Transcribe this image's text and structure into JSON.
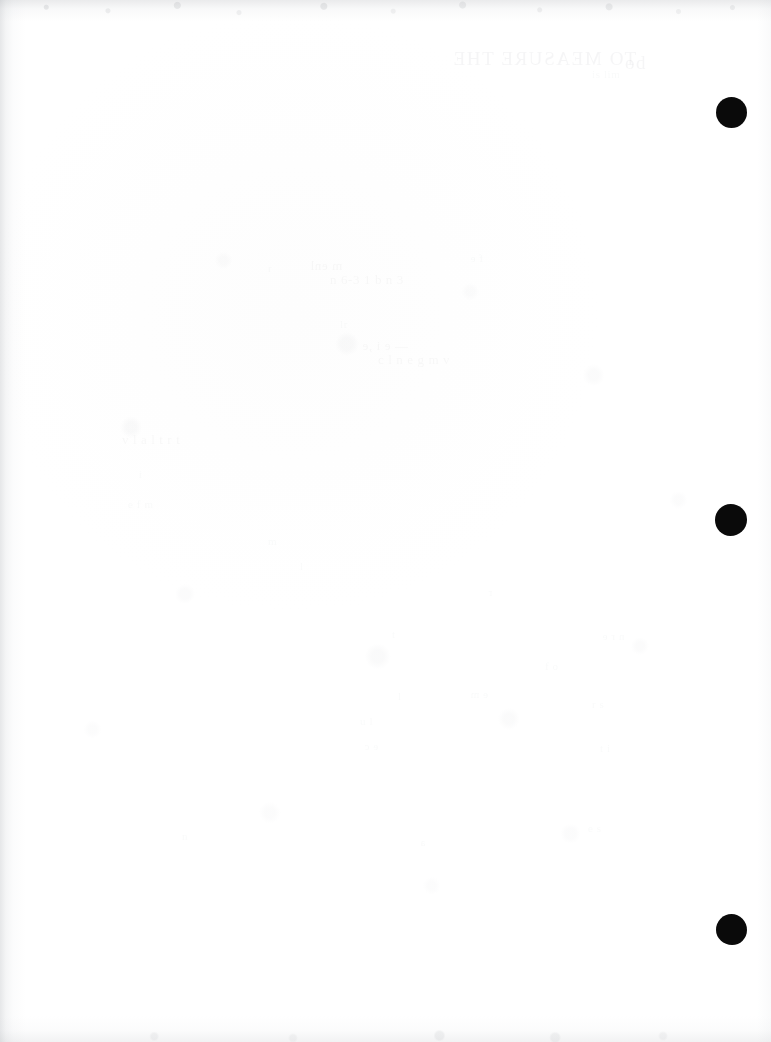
{
  "page": {
    "kind": "scanned-blank-page",
    "width": 771,
    "height": 1042,
    "background_color": "#ffffff",
    "mark_color": "#0a0a0a",
    "shadow_color": "#8c919a",
    "ghost_text_color": "#787c84"
  },
  "marks": {
    "label": "punch-marks",
    "items": [
      {
        "name": "punch-mark-top",
        "x": 716,
        "y": 97,
        "size": 31,
        "shape": "circle"
      },
      {
        "name": "punch-mark-middle",
        "x": 715,
        "y": 504,
        "size": 32,
        "shape": "circle-irregular"
      },
      {
        "name": "punch-mark-bottom",
        "x": 716,
        "y": 914,
        "size": 31,
        "shape": "circle-irregular"
      }
    ]
  },
  "ghost_text": {
    "note": "illegible bleed-through / show-through from the reverse side of the sheet",
    "lines": [
      {
        "x": 452,
        "y": 48,
        "text": "TO MEASURE THE",
        "style": "heading"
      },
      {
        "x": 625,
        "y": 52,
        "text": "od",
        "style": "heading"
      },
      {
        "x": 592,
        "y": 68,
        "text": "is  lim",
        "style": "small"
      },
      {
        "x": 310,
        "y": 258,
        "text": "m  enl",
        "style": "body"
      },
      {
        "x": 330,
        "y": 272,
        "text": "n  6-3  1  b        n 3",
        "style": "body"
      },
      {
        "x": 340,
        "y": 318,
        "text": "lr",
        "style": "small"
      },
      {
        "x": 362,
        "y": 338,
        "text": "— e  i ,e",
        "style": "body"
      },
      {
        "x": 378,
        "y": 352,
        "text": "c l  n e g  m   v",
        "style": "body"
      },
      {
        "x": 122,
        "y": 432,
        "text": "v l    a l t   r t",
        "style": "body"
      },
      {
        "x": 138,
        "y": 468,
        "text": "i",
        "style": "small"
      },
      {
        "x": 128,
        "y": 498,
        "text": "e  f m",
        "style": "small"
      },
      {
        "x": 268,
        "y": 262,
        "text": "r",
        "style": "small"
      },
      {
        "x": 470,
        "y": 252,
        "text": "f e",
        "style": "small"
      },
      {
        "x": 268,
        "y": 535,
        "text": "m",
        "style": "small"
      },
      {
        "x": 392,
        "y": 628,
        "text": "t",
        "style": "small"
      },
      {
        "x": 602,
        "y": 630,
        "text": "n  r e",
        "style": "small"
      },
      {
        "x": 545,
        "y": 660,
        "text": "f  o",
        "style": "small"
      },
      {
        "x": 398,
        "y": 690,
        "text": "l",
        "style": "small"
      },
      {
        "x": 470,
        "y": 688,
        "text": "e m",
        "style": "small"
      },
      {
        "x": 360,
        "y": 715,
        "text": "u  l",
        "style": "small"
      },
      {
        "x": 592,
        "y": 698,
        "text": "r  s",
        "style": "small"
      },
      {
        "x": 364,
        "y": 740,
        "text": "e  c",
        "style": "small"
      },
      {
        "x": 600,
        "y": 742,
        "text": "t  i",
        "style": "small"
      },
      {
        "x": 182,
        "y": 830,
        "text": "n",
        "style": "small"
      },
      {
        "x": 420,
        "y": 836,
        "text": "a",
        "style": "small"
      },
      {
        "x": 588,
        "y": 822,
        "text": "e  s",
        "style": "small"
      },
      {
        "x": 300,
        "y": 560,
        "text": "l",
        "style": "small"
      },
      {
        "x": 488,
        "y": 586,
        "text": "r",
        "style": "small"
      }
    ]
  }
}
